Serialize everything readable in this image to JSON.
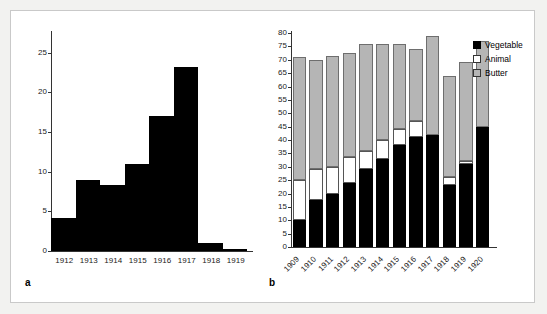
{
  "figure": {
    "background": "#ffffff",
    "panels": [
      {
        "letter": "a"
      },
      {
        "letter": "b"
      }
    ]
  },
  "legend": {
    "position": "top-right",
    "items": [
      {
        "label": "Vegetable",
        "color": "#000000",
        "swatch": "vegetable-swatch"
      },
      {
        "label": "Animal",
        "color": "#ffffff",
        "swatch": "animal-swatch"
      },
      {
        "label": "Butter",
        "color": "#b5b5b5",
        "swatch": "butter-swatch"
      }
    ]
  },
  "chart_data": [
    {
      "type": "bar",
      "panel": "a",
      "title": "",
      "xlabel": "",
      "ylabel": "",
      "categories": [
        "1912",
        "1913",
        "1914",
        "1915",
        "1916",
        "1917",
        "1918",
        "1919"
      ],
      "values": [
        4.2,
        9.0,
        8.3,
        11.0,
        17.0,
        23.2,
        1.0,
        0.2
      ],
      "ylim": [
        0,
        27.5
      ],
      "yticks": [
        0,
        5,
        10,
        15,
        20,
        25
      ],
      "ytick_labels": [
        "0",
        "5",
        "10",
        "15",
        "20",
        "25"
      ],
      "grid": false,
      "bar_color": "#000000",
      "legend": "none"
    },
    {
      "type": "bar",
      "panel": "b",
      "subtype": "stacked",
      "title": "",
      "xlabel": "",
      "ylabel": "",
      "categories": [
        "1909",
        "1910",
        "1911",
        "1912",
        "1913",
        "1914",
        "1915",
        "1916",
        "1917",
        "1918",
        "1919",
        "1920"
      ],
      "series": [
        {
          "name": "Vegetable",
          "color": "#000000",
          "values": [
            10.0,
            17.5,
            20.0,
            24.0,
            29.0,
            33.0,
            38.0,
            41.0,
            42.0,
            23.0,
            31.0,
            45.0
          ]
        },
        {
          "name": "Animal",
          "color": "#ffffff",
          "values": [
            15.0,
            11.5,
            10.0,
            9.5,
            7.0,
            7.0,
            6.0,
            6.0,
            0.0,
            3.0,
            1.0,
            0.0
          ]
        },
        {
          "name": "Butter",
          "color": "#b5b5b5",
          "values": [
            46.0,
            41.0,
            41.5,
            39.0,
            40.0,
            36.0,
            32.0,
            27.0,
            37.0,
            38.0,
            37.0,
            32.0
          ]
        }
      ],
      "totals": [
        71.0,
        70.0,
        71.5,
        72.5,
        76.0,
        76.0,
        76.0,
        74.0,
        79.0,
        64.0,
        69.0,
        77.0
      ],
      "ylim": [
        0,
        80
      ],
      "yticks": [
        0,
        5,
        10,
        15,
        20,
        25,
        30,
        35,
        40,
        45,
        50,
        55,
        60,
        65,
        70,
        75,
        80
      ],
      "ytick_labels": [
        "0",
        "5",
        "10",
        "15",
        "20",
        "25",
        "30",
        "35",
        "40",
        "45",
        "50",
        "55",
        "60",
        "65",
        "70",
        "75",
        "80"
      ],
      "grid": false,
      "legend": "top-right"
    }
  ]
}
